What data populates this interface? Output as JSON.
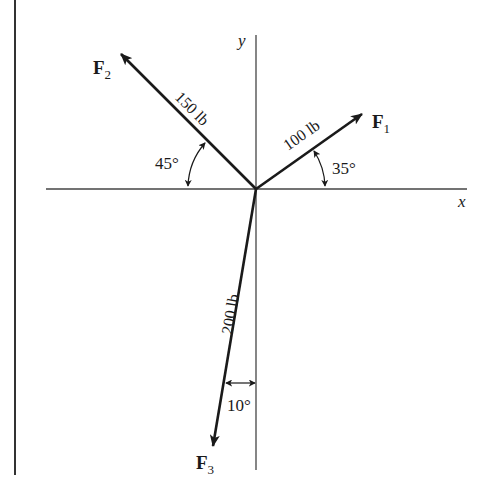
{
  "axes": {
    "x_label": "x",
    "y_label": "y"
  },
  "forces": [
    {
      "name": "F",
      "subscript": "1",
      "magnitude_label": "100 lb",
      "angle_label": "35°",
      "angle_deg": 35,
      "reference": "from +x axis, counterclockwise"
    },
    {
      "name": "F",
      "subscript": "2",
      "magnitude_label": "150 lb",
      "angle_label": "45°",
      "angle_deg": 45,
      "reference": "from −x axis, clockwise (up-left)"
    },
    {
      "name": "F",
      "subscript": "3",
      "magnitude_label": "200 lb",
      "angle_label": "10°",
      "angle_deg": 10,
      "reference": "from −y axis, toward −x"
    }
  ],
  "colors": {
    "ink": "#1a1a1a",
    "axis": "#333333",
    "background": "#ffffff"
  }
}
